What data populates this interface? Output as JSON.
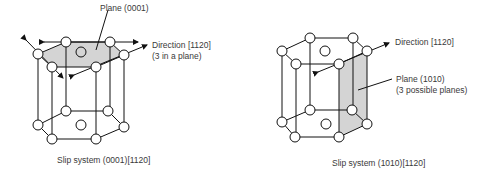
{
  "figures": [
    {
      "id": "basal",
      "labels": {
        "plane": "Plane (0001)",
        "direction_line1": "Direction [1120]",
        "direction_line2": "(3 in a plane)",
        "caption": "Slip system (0001)[1120]"
      }
    },
    {
      "id": "prismatic",
      "labels": {
        "direction_line1": "Direction [1120]",
        "plane_line1": "Plane (1010)",
        "plane_line2": "(3 possible planes)",
        "caption": "Slip system (1010)[1120]"
      }
    }
  ],
  "colors": {
    "line": "#111111",
    "shade": "#d4d4d4",
    "text": "#3a3a3a"
  }
}
